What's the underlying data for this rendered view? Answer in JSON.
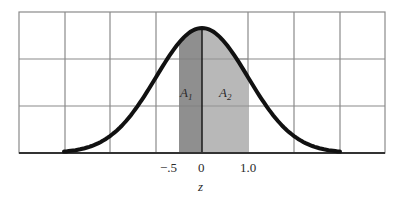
{
  "chart_data": {
    "type": "area",
    "title": "",
    "xlabel": "z",
    "ylabel": "",
    "xlim": [
      -4,
      4
    ],
    "tick_labels": [
      "-.5",
      "0",
      "1.0"
    ],
    "tick_values": [
      -0.5,
      0,
      1.0
    ],
    "grid": true,
    "grid_columns": 8,
    "grid_rows": 3,
    "shaded_regions": [
      {
        "name": "A1",
        "from": -0.5,
        "to": 0,
        "color": "#8f8f8f"
      },
      {
        "name": "A2",
        "from": 0,
        "to": 1.0,
        "color": "#b8b8b8"
      }
    ],
    "curve": {
      "distribution": "normal",
      "mean": 0,
      "sd": 1
    }
  },
  "labels": {
    "area1_main": "A",
    "area1_sub": "1",
    "area2_main": "A",
    "area2_sub": "2",
    "tick_neg_half": "−.5",
    "tick_zero": "0",
    "tick_one": "1.0",
    "axis_label": "z"
  }
}
